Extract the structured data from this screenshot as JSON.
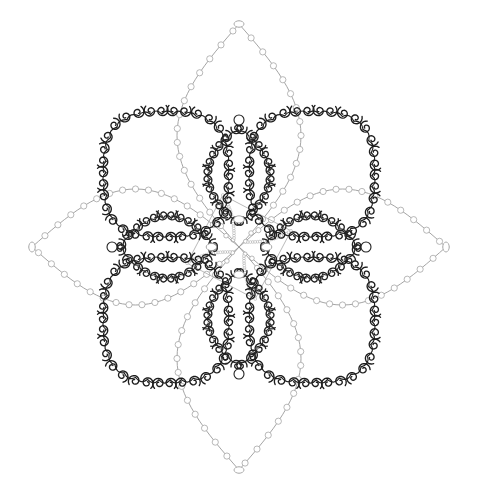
{
  "artwork": {
    "title": "Ornamental Beaded Mandala Motif",
    "kind": "line-art-ornament",
    "symmetry": "4-fold rotational (D4), vertical and horizontal mirror",
    "background_color": "#ffffff",
    "canvas": {
      "width": 478,
      "height": 503
    },
    "center": {
      "x": 239,
      "y": 247
    },
    "bounds": {
      "left": 30,
      "top": 22,
      "right": 448,
      "bottom": 472
    }
  },
  "palette": {
    "background": "#ffffff",
    "outer_petal_stroke": "#9a9a9a",
    "outer_petal_bead_fill": "#ffffff",
    "outer_petal_bead_stroke": "#a6a6a6",
    "corner_petal_stroke": "#1d1d1d",
    "inner_petal_stroke": "#222222",
    "center_cross_stroke": "#a8a8a8",
    "spiral_fill": "none",
    "accent_dark": "#111111",
    "accent_light": "#b5b5b5"
  },
  "layers": [
    {
      "name": "outer-petals",
      "label": "Outer beaded lens petals",
      "count": 4,
      "style": "light-gray beaded chain",
      "stroke": "#9a9a9a",
      "stroke_width": 0.9,
      "bead_radius": 3.1,
      "bead_count_per_petal": 64,
      "petals": [
        {
          "id": "outer-petal-north",
          "direction": "north",
          "angle_deg": -90,
          "tip": {
            "x": 239,
            "y": 24
          },
          "length": 223,
          "half_width": 62
        },
        {
          "id": "outer-petal-east",
          "direction": "east",
          "angle_deg": 0,
          "tip": {
            "x": 446,
            "y": 247
          },
          "length": 207,
          "half_width": 58
        },
        {
          "id": "outer-petal-south",
          "direction": "south",
          "angle_deg": 90,
          "tip": {
            "x": 239,
            "y": 470
          },
          "length": 223,
          "half_width": 62
        },
        {
          "id": "outer-petal-west",
          "direction": "west",
          "angle_deg": 180,
          "tip": {
            "x": 32,
            "y": 247
          },
          "length": 207,
          "half_width": 58
        }
      ]
    },
    {
      "name": "corner-petals",
      "label": "Diagonal spiral-curl petals",
      "count": 4,
      "style": "dark spiral scroll outline, rounded-square lobe",
      "stroke": "#1d1d1d",
      "stroke_width": 1.35,
      "spiral_radius": 6.6,
      "spirals_per_petal": 34,
      "petals": [
        {
          "id": "corner-petal-northwest",
          "direction": "northwest",
          "angle_deg": -135,
          "center": {
            "x": 166,
            "y": 174
          },
          "radius": 60
        },
        {
          "id": "corner-petal-northeast",
          "direction": "northeast",
          "angle_deg": -45,
          "center": {
            "x": 312,
            "y": 174
          },
          "radius": 60
        },
        {
          "id": "corner-petal-southeast",
          "direction": "southeast",
          "angle_deg": 45,
          "center": {
            "x": 312,
            "y": 320
          },
          "radius": 60
        },
        {
          "id": "corner-petal-southwest",
          "direction": "southwest",
          "angle_deg": 135,
          "center": {
            "x": 166,
            "y": 320
          },
          "radius": 60
        }
      ]
    },
    {
      "name": "inner-petals",
      "label": "Inner spiral-curl pointed petals",
      "count": 4,
      "style": "dark spiral scroll outline, pointed oval",
      "stroke": "#222222",
      "stroke_width": 1.35,
      "spiral_radius": 6.2,
      "spirals_per_petal": 22,
      "base_bead_radius": 5.0,
      "petals": [
        {
          "id": "inner-petal-north",
          "direction": "north",
          "angle_deg": -90,
          "tip": {
            "x": 239,
            "y": 120
          },
          "length": 92,
          "half_width": 29
        },
        {
          "id": "inner-petal-east",
          "direction": "east",
          "angle_deg": 0,
          "tip": {
            "x": 366,
            "y": 247
          },
          "length": 92,
          "half_width": 29
        },
        {
          "id": "inner-petal-south",
          "direction": "south",
          "angle_deg": 90,
          "tip": {
            "x": 239,
            "y": 374
          },
          "length": 92,
          "half_width": 29
        },
        {
          "id": "inner-petal-west",
          "direction": "west",
          "angle_deg": 180,
          "tip": {
            "x": 112,
            "y": 247
          },
          "length": 92,
          "half_width": 29
        }
      ]
    },
    {
      "name": "center-cross",
      "label": "Central beaded concave cross",
      "count": 1,
      "style": "light-gray fine beaded chain",
      "stroke": "#a8a8a8",
      "stroke_width": 0.8,
      "bead_radius": 1.4,
      "arm_half_width": 9,
      "arm_length": 52
    }
  ],
  "motifs": {
    "spiral": {
      "name": "spiral-curl",
      "turns": 1.35,
      "direction": "alternating"
    },
    "bead": {
      "name": "bead-circle",
      "shape": "circle"
    }
  },
  "counts": {
    "outer_petals": 4,
    "corner_petals": 4,
    "inner_petals": 4,
    "total_petals": 12,
    "center_shapes": 1
  }
}
